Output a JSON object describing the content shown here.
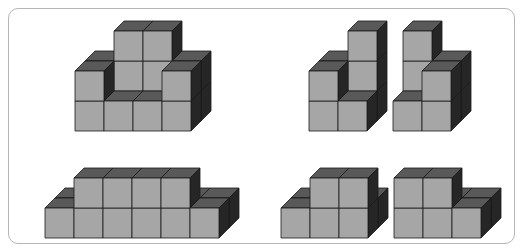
{
  "colors": {
    "front": "#a6a6a6",
    "top": "#595959",
    "side": "#262626",
    "edge": "#1a1a1a",
    "frame": "#b5b5b5"
  },
  "cube": {
    "w": 29,
    "h": 30,
    "dx": 10,
    "dy": 10
  },
  "figures": [
    {
      "name": "figure-top-left",
      "ox": 75,
      "oy": 131,
      "cubes": [
        [
          0,
          0,
          1
        ],
        [
          1,
          0,
          1
        ],
        [
          2,
          0,
          1
        ],
        [
          3,
          0,
          1
        ],
        [
          0,
          0,
          0
        ],
        [
          1,
          0,
          0
        ],
        [
          2,
          0,
          0
        ],
        [
          3,
          0,
          0
        ],
        [
          0,
          1,
          0
        ],
        [
          3,
          1,
          0
        ],
        [
          1,
          1,
          1
        ],
        [
          2,
          1,
          1
        ],
        [
          1,
          2,
          1
        ],
        [
          2,
          2,
          1
        ],
        [
          0,
          1,
          1
        ],
        [
          3,
          1,
          1
        ]
      ]
    },
    {
      "name": "figure-top-right-a",
      "ox": 309,
      "oy": 131,
      "cubes": [
        [
          0,
          0,
          1
        ],
        [
          1,
          0,
          1
        ],
        [
          0,
          0,
          0
        ],
        [
          1,
          0,
          0
        ],
        [
          0,
          1,
          1
        ],
        [
          0,
          1,
          0
        ],
        [
          1,
          1,
          1
        ],
        [
          1,
          2,
          1
        ]
      ]
    },
    {
      "name": "figure-top-right-b",
      "ox": 393,
      "oy": 131,
      "cubes": [
        [
          0,
          0,
          1
        ],
        [
          1,
          0,
          1
        ],
        [
          0,
          0,
          0
        ],
        [
          1,
          0,
          0
        ],
        [
          1,
          1,
          1
        ],
        [
          1,
          1,
          0
        ],
        [
          0,
          1,
          1
        ],
        [
          0,
          2,
          1
        ]
      ]
    },
    {
      "name": "figure-bottom-left",
      "ox": 45,
      "oy": 238,
      "cubes": [
        [
          0,
          0,
          1
        ],
        [
          1,
          0,
          1
        ],
        [
          2,
          0,
          1
        ],
        [
          3,
          0,
          1
        ],
        [
          4,
          0,
          1
        ],
        [
          5,
          0,
          1
        ],
        [
          0,
          0,
          0
        ],
        [
          1,
          0,
          0
        ],
        [
          2,
          0,
          0
        ],
        [
          3,
          0,
          0
        ],
        [
          4,
          0,
          0
        ],
        [
          5,
          0,
          0
        ],
        [
          1,
          1,
          0
        ],
        [
          2,
          1,
          0
        ],
        [
          3,
          1,
          0
        ],
        [
          4,
          1,
          0
        ]
      ]
    },
    {
      "name": "figure-bottom-right-a",
      "ox": 281,
      "oy": 238,
      "cubes": [
        [
          0,
          0,
          1
        ],
        [
          1,
          0,
          1
        ],
        [
          2,
          0,
          1
        ],
        [
          0,
          0,
          0
        ],
        [
          1,
          0,
          0
        ],
        [
          2,
          0,
          0
        ],
        [
          1,
          1,
          0
        ],
        [
          2,
          1,
          0
        ]
      ]
    },
    {
      "name": "figure-bottom-right-b",
      "ox": 394,
      "oy": 238,
      "cubes": [
        [
          0,
          0,
          1
        ],
        [
          1,
          0,
          1
        ],
        [
          2,
          0,
          1
        ],
        [
          0,
          0,
          0
        ],
        [
          1,
          0,
          0
        ],
        [
          2,
          0,
          0
        ],
        [
          0,
          1,
          0
        ],
        [
          1,
          1,
          0
        ]
      ]
    }
  ]
}
